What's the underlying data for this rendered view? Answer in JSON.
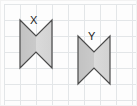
{
  "figure": {
    "width": 137,
    "height": 106,
    "background_color": "#fdfdfd"
  },
  "grid": {
    "name": "square-grid",
    "cell_size": 16,
    "origin_x": 4,
    "origin_y": 4,
    "columns": 9,
    "rows": 7,
    "line_color": "#e3e6e8",
    "line_width": 1,
    "visible": true
  },
  "shapes": [
    {
      "id": "shape-x",
      "label": "X",
      "type": "bowtie",
      "label_position": {
        "x": 30,
        "y": 15
      },
      "bounds": {
        "left": 20,
        "top": 20,
        "right": 52,
        "bottom": 68
      },
      "points": "20,20 36,36 52,20 52,68 36,52 20,68",
      "fill_left": "#c4c4c4",
      "fill_right": "#d7d7d7",
      "stroke": "#4a4a4a",
      "stroke_width": 1.2
    },
    {
      "id": "shape-y",
      "label": "Y",
      "type": "bowtie",
      "label_position": {
        "x": 88,
        "y": 31
      },
      "bounds": {
        "left": 78,
        "top": 36,
        "right": 110,
        "bottom": 84
      },
      "points": "78,36 94,52 110,36 110,84 94,68 78,84",
      "fill_left": "#c4c4c4",
      "fill_right": "#d7d7d7",
      "stroke": "#4a4a4a",
      "stroke_width": 1.2
    }
  ],
  "colors": {
    "grid_line": "#e3e6e8",
    "shape_stroke": "#4a4a4a",
    "shape_fill_dark": "#c4c4c4",
    "shape_fill_light": "#d7d7d7",
    "label_text": "#1b1b1b",
    "page_background": "#fdfdfd"
  }
}
